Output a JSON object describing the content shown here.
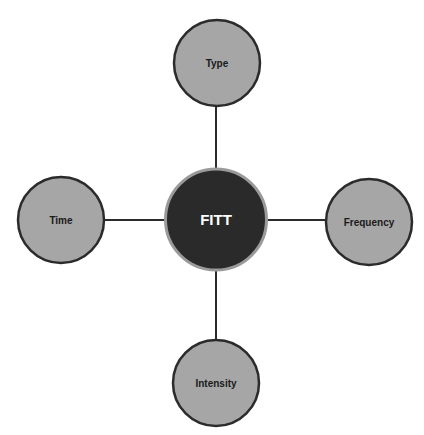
{
  "diagram": {
    "type": "hub-and-spoke",
    "center": {
      "label": "FITT",
      "fill": "#2a2a2a",
      "stroke": "#9a9a9a",
      "text_color": "#ffffff"
    },
    "nodes": [
      {
        "label": "Type",
        "position": "top",
        "fill": "#a6a6a6",
        "stroke": "#2b2b2b"
      },
      {
        "label": "Frequency",
        "position": "right",
        "fill": "#a6a6a6",
        "stroke": "#2b2b2b"
      },
      {
        "label": "Intensity",
        "position": "bottom",
        "fill": "#a6a6a6",
        "stroke": "#2b2b2b"
      },
      {
        "label": "Time",
        "position": "left",
        "fill": "#a6a6a6",
        "stroke": "#2b2b2b"
      }
    ],
    "connector_color": "#2b2b2b"
  }
}
